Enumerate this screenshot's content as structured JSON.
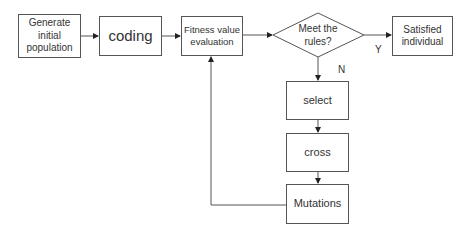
{
  "nodes": {
    "generate": "Generate initial population",
    "coding": "coding",
    "fitness": "Fitness value evaluation",
    "decision": "Meet the rules?",
    "satisfied": "Satisfied individual",
    "select": "select",
    "cross": "cross",
    "mutations": "Mutations"
  },
  "edge_labels": {
    "yes": "Y",
    "no": "N"
  },
  "colors": {
    "stroke": "#555555",
    "text": "#333333",
    "background": "#ffffff"
  }
}
